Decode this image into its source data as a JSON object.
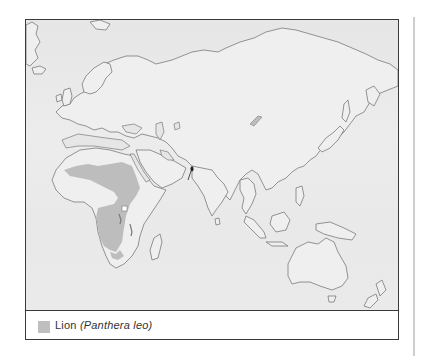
{
  "map": {
    "title": "Lion distribution map",
    "projection_region": "Africa, Europe, Asia, Oceania",
    "colors": {
      "ocean": "#e8e8e8",
      "land": "#efefef",
      "coastline": "#7a7a7a",
      "range_fill": "#bdbdbd",
      "frame": "#3a3a3a",
      "marker": "#222222"
    },
    "features": [
      {
        "name": "Africa range",
        "type": "range-area",
        "region": "Sub-Saharan Africa"
      },
      {
        "name": "Gir Forest population",
        "type": "point-marker",
        "region": "Gujarat, India"
      }
    ]
  },
  "legend": {
    "items": [
      {
        "swatch_color": "#bfbfbf",
        "common_name": "Lion",
        "scientific_name_open": "(",
        "scientific_name": "Panthera leo",
        "scientific_name_close": ")"
      }
    ]
  }
}
